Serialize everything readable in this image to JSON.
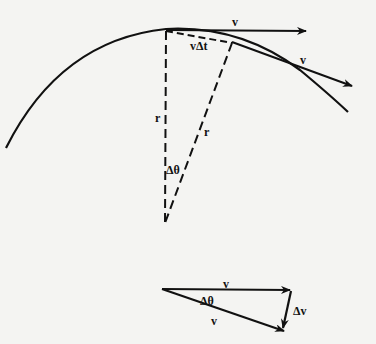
{
  "diagram": {
    "type": "circular-motion-velocity-change",
    "colors": {
      "ink": "#111111",
      "background": "#f4f4f2"
    },
    "labels": {
      "velocity_top": "v",
      "velocity_tangent": "v",
      "arc_displacement": "vΔt",
      "radius_left": "r",
      "radius_right": "r",
      "angle_center": "Δθ",
      "triangle_velocity_top": "v",
      "triangle_angle": "Δθ",
      "triangle_velocity_bottom": "v",
      "triangle_delta_v": "Δv"
    }
  }
}
